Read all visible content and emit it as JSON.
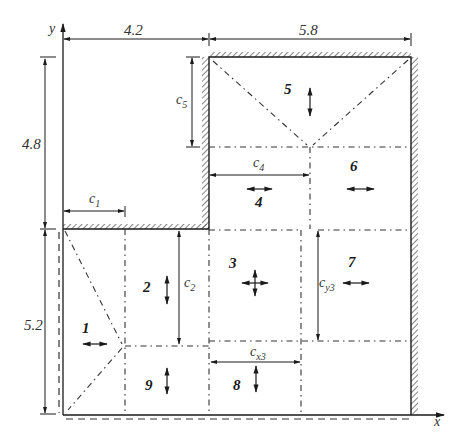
{
  "figure": {
    "axes": {
      "x_label": "x",
      "y_label": "y"
    },
    "dimensions": {
      "top_left": "4.2",
      "top_right": "5.8",
      "left_upper": "4.8",
      "left_lower": "5.2"
    },
    "lengths": {
      "c1": {
        "base": "c",
        "sub": "1"
      },
      "c2": {
        "base": "c",
        "sub": "2"
      },
      "c4": {
        "base": "c",
        "sub": "4"
      },
      "c5": {
        "base": "c",
        "sub": "5"
      },
      "cx3": {
        "base": "c",
        "sub": "x3"
      },
      "cy3": {
        "base": "c",
        "sub": "y3"
      }
    },
    "regions": [
      {
        "id": "1",
        "motion": "horizontal"
      },
      {
        "id": "2",
        "motion": "vertical"
      },
      {
        "id": "3",
        "motion": "both"
      },
      {
        "id": "4",
        "motion": "horizontal"
      },
      {
        "id": "5",
        "motion": "vertical"
      },
      {
        "id": "6",
        "motion": "horizontal"
      },
      {
        "id": "7",
        "motion": "horizontal"
      },
      {
        "id": "8",
        "motion": "vertical"
      },
      {
        "id": "9",
        "motion": "vertical"
      }
    ],
    "colors": {
      "line": "#1a1a1a",
      "hatch": "#333333",
      "background": "#ffffff"
    }
  }
}
